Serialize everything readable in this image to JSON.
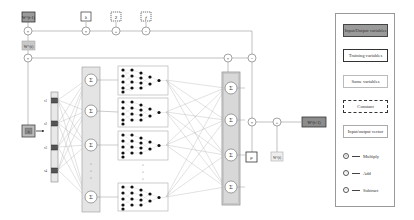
{
  "diagram": {
    "top_row": {
      "w_prev_label": "W^(t-1)",
      "w_curr_label": "W^(t)",
      "lambda_label": "λ",
      "const_two_label": "2",
      "f_label": "f"
    },
    "input": {
      "x_label": "x",
      "nodes": [
        "x1",
        "x2",
        "x3",
        "x4"
      ]
    },
    "hidden_sigma_column": {
      "symbol": "Σ",
      "count_visible": 4,
      "ellipsis": "⋮"
    },
    "subnetworks": {
      "count_visible": 4,
      "layer_sizes": [
        5,
        5,
        4,
        2,
        1
      ],
      "ellipsis": "⋮"
    },
    "output_sigma_column": {
      "symbol": "Σ",
      "count_visible": 4
    },
    "bottom_ops": {
      "mu_label": "μ",
      "w_curr_label": "W^(t)",
      "output_label": "W^(t+1)"
    },
    "operators": {
      "multiply": "×",
      "add": "+",
      "subtract": "−"
    }
  },
  "legend": {
    "items": [
      {
        "type": "io",
        "label": "Input/Output variables"
      },
      {
        "type": "train",
        "label": "Training variables"
      },
      {
        "type": "same",
        "label": "Same variables"
      },
      {
        "type": "const",
        "label": "Constant"
      },
      {
        "type": "vec",
        "label": "Input/output vector"
      }
    ],
    "ops": [
      {
        "symbol": "×",
        "label": "Multiply"
      },
      {
        "symbol": "+",
        "label": "Add"
      },
      {
        "symbol": "−",
        "label": "Subtract"
      }
    ]
  },
  "colors": {
    "io_fill": "#9a9a9a",
    "vector_fill": "#e4e4e4",
    "line": "#999999",
    "node_dark": "#111111"
  }
}
